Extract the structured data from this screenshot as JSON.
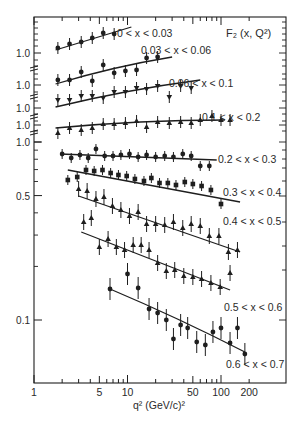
{
  "chart_data": {
    "type": "scatter",
    "xlabel": "q² (GeV/c)²",
    "ylabel": "",
    "xscale": "log",
    "yscale": "log",
    "xlim": [
      1,
      300
    ],
    "x_ticks": [
      1,
      5,
      10,
      50,
      100,
      200
    ],
    "x_tick_labels": [
      "1",
      "5",
      "10",
      "50",
      "100",
      "200"
    ],
    "y_tick_labels_stacked": [
      "1.0",
      "1.0",
      "1.0",
      "1.0",
      "1.0"
    ],
    "y_ticks_lower": [
      1.0,
      0.5,
      0.1
    ],
    "y_tick_labels_lower": [
      "1.0",
      "0.5",
      "0.1"
    ],
    "grid": false,
    "legend": "none (series labelled inline)",
    "series": [
      {
        "name": "0 < x < 0.03",
        "panel": "offset-1",
        "x": [
          1.8,
          2.4,
          3.2,
          4.2,
          5.5,
          7.2
        ],
        "y_px": [
          48,
          44,
          42,
          38,
          33,
          34
        ],
        "fit": [
          [
            1.7,
            50
          ],
          [
            11,
            27
          ]
        ]
      },
      {
        "name": "0.03 < x < 0.06",
        "panel": "offset-2",
        "x": [
          1.8,
          2.4,
          3.2,
          4.2,
          5.5,
          7.2,
          9.5,
          12.5,
          16,
          21
        ],
        "y_px": [
          80,
          80,
          72,
          81,
          65,
          73,
          71,
          70,
          58,
          57
        ],
        "fit": [
          [
            1.7,
            84
          ],
          [
            30,
            57
          ]
        ]
      },
      {
        "name": "0.06 < x < 0.1",
        "panel": "offset-3",
        "x": [
          1.8,
          2.4,
          3.2,
          4.2,
          5.5,
          7.2,
          9.5,
          12.5,
          16,
          21,
          28,
          37,
          48
        ],
        "y_px": [
          100,
          100,
          96,
          96,
          98,
          92,
          92,
          88,
          89,
          86,
          97,
          86,
          88
        ],
        "fit": [
          [
            1.7,
            107
          ],
          [
            60,
            80
          ]
        ]
      },
      {
        "name": "0.1 < x < 0.2",
        "panel": "offset-4",
        "x": [
          1.8,
          2.4,
          3.2,
          4.2,
          5.5,
          7.2,
          9.5,
          12.5,
          16,
          21,
          28,
          37,
          48,
          60,
          80,
          100,
          125
        ],
        "y_px": [
          133,
          128,
          130,
          128,
          124,
          124,
          123,
          121,
          127,
          122,
          123,
          122,
          123,
          120,
          116,
          120,
          120
        ],
        "fit": [
          [
            1.7,
            128
          ],
          [
            110,
            120
          ]
        ]
      },
      {
        "name": "0.2 < x < 0.3",
        "panel": "lower",
        "x": [
          2.0,
          2.5,
          3.1,
          3.8,
          4.6,
          5.7,
          7.0,
          8.5,
          10.5,
          13,
          16,
          20,
          25,
          31,
          39,
          48,
          60,
          75
        ],
        "y_px": [
          154,
          158,
          155,
          158,
          149,
          156,
          156,
          155,
          154,
          157,
          155,
          157,
          156,
          157,
          154,
          156,
          166,
          166
        ],
        "F2_approx": [
          0.88,
          0.84,
          0.87,
          0.84,
          0.93,
          0.86,
          0.86,
          0.87,
          0.88,
          0.85,
          0.87,
          0.85,
          0.86,
          0.85,
          0.88,
          0.86,
          0.78,
          0.78
        ],
        "fit": [
          [
            1.9,
            154
          ],
          [
            90,
            160
          ]
        ]
      },
      {
        "name": "0.3 < x < 0.4",
        "panel": "lower",
        "x": [
          2.3,
          2.9,
          3.6,
          4.4,
          5.4,
          6.6,
          8.0,
          9.8,
          12,
          15,
          18,
          22,
          27,
          33,
          41,
          50,
          62,
          78,
          100
        ],
        "y_px": [
          180,
          177,
          170,
          171,
          170,
          173,
          175,
          176,
          179,
          181,
          178,
          183,
          183,
          185,
          182,
          184,
          186,
          190,
          204
        ],
        "F2_approx": [
          0.65,
          0.67,
          0.72,
          0.71,
          0.72,
          0.69,
          0.68,
          0.67,
          0.65,
          0.63,
          0.66,
          0.61,
          0.61,
          0.59,
          0.62,
          0.6,
          0.59,
          0.56,
          0.47
        ],
        "fit": [
          [
            2.3,
            170
          ],
          [
            160,
            202
          ]
        ]
      },
      {
        "name": "0.4 < x < 0.5",
        "panel": "lower",
        "x": [
          3.0,
          3.7,
          4.6,
          5.6,
          6.9,
          8.5,
          10.5,
          13,
          16,
          20,
          25,
          31,
          39,
          48,
          60,
          75,
          95,
          120,
          150
        ],
        "y_px": [
          189,
          191,
          199,
          197,
          206,
          210,
          216,
          212,
          224,
          224,
          225,
          222,
          228,
          224,
          226,
          236,
          236,
          252,
          250
        ],
        "F2_approx": [
          0.57,
          0.56,
          0.51,
          0.52,
          0.47,
          0.45,
          0.42,
          0.44,
          0.39,
          0.39,
          0.38,
          0.4,
          0.37,
          0.39,
          0.38,
          0.34,
          0.34,
          0.28,
          0.29
        ],
        "fit": [
          [
            3.0,
            196
          ],
          [
            160,
            252
          ]
        ]
      },
      {
        "name": "0.5 < x < 0.6",
        "panel": "lower",
        "x": [
          3.4,
          4.1,
          5.0,
          6.2,
          7.6,
          9.3,
          11.5,
          14,
          17,
          21,
          26,
          32,
          40,
          50,
          62,
          78,
          98,
          125
        ],
        "y_px": [
          222,
          218,
          247,
          239,
          247,
          250,
          245,
          245,
          250,
          263,
          271,
          270,
          276,
          277,
          279,
          283,
          287,
          273
        ],
        "F2_approx": [
          0.3,
          0.32,
          0.23,
          0.25,
          0.23,
          0.22,
          0.23,
          0.23,
          0.22,
          0.19,
          0.17,
          0.17,
          0.16,
          0.16,
          0.15,
          0.15,
          0.14,
          0.16
        ],
        "fit": [
          [
            3.2,
            232
          ],
          [
            125,
            290
          ]
        ]
      },
      {
        "name": "0.6 < x < 0.7",
        "panel": "lower",
        "x": [
          6.5,
          10,
          13,
          17,
          21,
          26,
          31,
          37,
          44,
          55,
          68,
          82,
          100,
          125,
          150,
          180
        ],
        "y_px": [
          289,
          274,
          288,
          309,
          313,
          320,
          339,
          325,
          328,
          342,
          345,
          332,
          328,
          343,
          328,
          354
        ],
        "F2_approx": [
          0.14,
          0.17,
          0.14,
          0.11,
          0.105,
          0.1,
          0.078,
          0.094,
          0.09,
          0.075,
          0.072,
          0.085,
          0.089,
          0.074,
          0.089,
          0.063
        ],
        "fit": [
          [
            6.5,
            289
          ],
          [
            180,
            352
          ]
        ]
      }
    ]
  },
  "labels": {
    "title": "F₂ (x, Q²)",
    "xaxis": "q²  (GeV/c)²",
    "series_labels": [
      {
        "text": "0 < x < 0.03",
        "x": 117,
        "y": 37
      },
      {
        "text": "0.03 < x < 0.06",
        "x": 141,
        "y": 54
      },
      {
        "text": "0.06 < x < 0.1",
        "x": 169,
        "y": 87
      },
      {
        "text": "0.1 < x < 0.2",
        "x": 202,
        "y": 121
      },
      {
        "text": "0.2 < x < 0.3",
        "x": 218,
        "y": 163
      },
      {
        "text": "0.3 < x < 0.4",
        "x": 223,
        "y": 196
      },
      {
        "text": "0.4 < x < 0.5",
        "x": 223,
        "y": 225
      },
      {
        "text": "0.5 < x < 0.6",
        "x": 224,
        "y": 311
      },
      {
        "text": "0.6 < x < 0.7",
        "x": 226,
        "y": 368
      }
    ]
  }
}
